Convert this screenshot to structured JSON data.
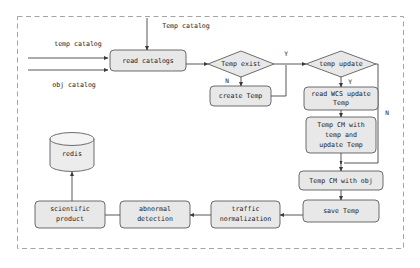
{
  "diagram": {
    "frame": {
      "style": "dashed",
      "color": "#9a9a9a"
    },
    "colors": {
      "node_fill": "#e8e8e8",
      "node_stroke": "#4a4a4a",
      "connector": "#3a3a3a",
      "frame": "#9a9a9a",
      "text": "#1a1a1a",
      "background": "#ffffff"
    },
    "nodes": [
      {
        "id": "read_catalogs",
        "shape": "rounded-rect",
        "lines": [
          "read catalogs"
        ]
      },
      {
        "id": "temp_exist",
        "shape": "diamond",
        "lines": [
          "Temp exist"
        ]
      },
      {
        "id": "create_temp",
        "shape": "rounded-rect",
        "lines": [
          "create Temp"
        ]
      },
      {
        "id": "temp_update",
        "shape": "diamond",
        "lines": [
          "temp update"
        ]
      },
      {
        "id": "read_wcs_update_temp",
        "shape": "rounded-rect",
        "lines": [
          "read WCS update",
          "Temp"
        ]
      },
      {
        "id": "temp_cm_temp",
        "shape": "rounded-rect",
        "lines": [
          "Temp CM with",
          "temp and",
          "update Temp"
        ]
      },
      {
        "id": "temp_cm_obj",
        "shape": "rounded-rect",
        "lines": [
          "Temp CM with obj"
        ]
      },
      {
        "id": "save_temp",
        "shape": "rounded-rect",
        "lines": [
          "save Temp"
        ]
      },
      {
        "id": "traffic_norm",
        "shape": "rounded-rect",
        "lines": [
          "traffic",
          "normalization"
        ]
      },
      {
        "id": "abnormal_detection",
        "shape": "rounded-rect",
        "lines": [
          "abnormal",
          "detection"
        ]
      },
      {
        "id": "scientific_product",
        "shape": "rounded-rect",
        "lines": [
          "scientific",
          "product"
        ]
      },
      {
        "id": "redis",
        "shape": "cylinder",
        "lines": [
          "redis"
        ]
      }
    ],
    "input_labels": {
      "top": "Temp catalog",
      "left_upper": "temp catalog",
      "left_lower": "obj catalog"
    },
    "branch_labels": {
      "temp_exist_yes": "Y",
      "temp_exist_no": "N",
      "temp_update_yes": "Y",
      "temp_update_no": "N"
    },
    "node_text": {
      "read_catalogs": "read catalogs",
      "temp_exist": "Temp exist",
      "create_temp": "create Temp",
      "temp_update": "temp update",
      "read_wcs_1": "read WCS update",
      "read_wcs_2": "Temp",
      "temp_cm_temp_1": "Temp CM with",
      "temp_cm_temp_2": "temp and",
      "temp_cm_temp_3": "update Temp",
      "temp_cm_obj": "Temp CM with obj",
      "save_temp": "save Temp",
      "traffic_1": "traffic",
      "traffic_2": "normalization",
      "abnormal_1": "abnormal",
      "abnormal_2": "detection",
      "scientific_1": "scientific",
      "scientific_2": "product",
      "redis": "redis"
    }
  }
}
